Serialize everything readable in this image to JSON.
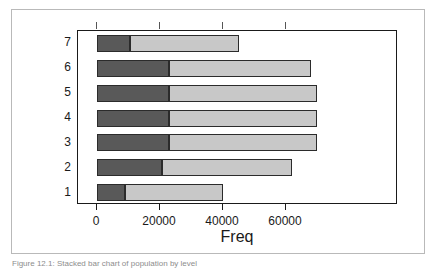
{
  "figure": {
    "caption": "Figure 12.1: Stacked bar chart of population by level",
    "background": "#ffffff",
    "frame_color": "#b9b9b9"
  },
  "chart_data": {
    "type": "bar",
    "orientation": "horizontal",
    "stacked": true,
    "title": "",
    "subtitle": "",
    "xlabel": "Freq",
    "ylabel": "",
    "grid": false,
    "legend": null,
    "categories": [
      "1",
      "2",
      "3",
      "4",
      "5",
      "6",
      "7"
    ],
    "category_order_top_to_bottom": [
      "7",
      "6",
      "5",
      "4",
      "3",
      "2",
      "1"
    ],
    "xlim": [
      0,
      75000
    ],
    "xticks": [
      0,
      20000,
      40000,
      60000
    ],
    "xtick_labels": [
      "0",
      "20000",
      "40000",
      "60000"
    ],
    "series": [
      {
        "name": "dark",
        "color": "#595959",
        "values": [
          9000,
          20500,
          23000,
          23000,
          23000,
          23000,
          10500
        ]
      },
      {
        "name": "light",
        "color": "#c8c8c8",
        "values": [
          31000,
          41500,
          47000,
          47000,
          47000,
          45000,
          34500
        ]
      }
    ],
    "totals": [
      40000,
      62000,
      70000,
      70000,
      70000,
      68000,
      45000
    ]
  },
  "axis_title": {
    "text": "Freq"
  }
}
